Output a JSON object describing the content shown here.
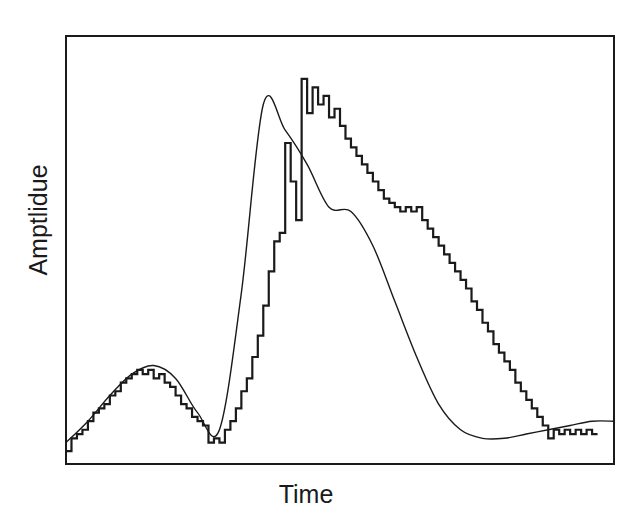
{
  "chart_data": {
    "type": "line",
    "title": "",
    "xlabel": "Time",
    "ylabel": "Amptlidue",
    "grid": false,
    "legend": null,
    "axis_ticks": false,
    "xlim": [
      0,
      100
    ],
    "ylim": [
      0,
      100
    ],
    "series": [
      {
        "name": "smooth-signal",
        "style": "smooth-line",
        "x": [
          0,
          4,
          8,
          12,
          16,
          20,
          24,
          28,
          32,
          36,
          40,
          44,
          48,
          52,
          56,
          60,
          64,
          68,
          72,
          76,
          80,
          84,
          88,
          92,
          96,
          100
        ],
        "y": [
          5,
          10,
          16,
          21,
          23,
          20,
          12,
          8,
          40,
          84,
          78,
          70,
          60,
          59,
          51,
          38,
          25,
          14,
          8,
          6,
          6,
          7,
          8,
          9,
          10,
          10
        ]
      },
      {
        "name": "quantized-staircase",
        "style": "step-line",
        "x": [
          0,
          1,
          2,
          3,
          4,
          5,
          6,
          7,
          8,
          9,
          10,
          11,
          12,
          13,
          14,
          15,
          16,
          17,
          18,
          19,
          20,
          21,
          22,
          23,
          24,
          25,
          26,
          27,
          28,
          29,
          30,
          31,
          32,
          33,
          34,
          35,
          36,
          37,
          38,
          39,
          40,
          41,
          42,
          43,
          44,
          45,
          46,
          47,
          48,
          49,
          50,
          51,
          52,
          53,
          54,
          55,
          56,
          57,
          58,
          59,
          60,
          61,
          62,
          63,
          64,
          65,
          66,
          67,
          68,
          69,
          70,
          71,
          72,
          73,
          74,
          75,
          76,
          77,
          78,
          79,
          80,
          81,
          82,
          83,
          84,
          85,
          86,
          87,
          88,
          89,
          90,
          91,
          92,
          93,
          94,
          95,
          96
        ],
        "y": [
          3,
          6,
          7,
          8,
          10,
          12,
          13,
          14,
          16,
          17,
          19,
          20,
          21,
          22,
          21,
          22,
          20,
          21,
          19,
          18,
          16,
          14,
          13,
          11,
          10,
          9,
          5,
          6,
          5,
          8,
          10,
          13,
          17,
          20,
          25,
          30,
          37,
          45,
          52,
          54,
          75,
          66,
          57,
          90,
          82,
          88,
          84,
          86,
          81,
          83,
          79,
          76,
          74,
          72,
          70,
          68,
          66,
          64,
          62,
          61,
          60,
          59,
          60,
          59,
          60,
          57,
          55,
          53,
          51,
          49,
          47,
          45,
          43,
          41,
          38,
          36,
          33,
          31,
          28,
          26,
          24,
          22,
          19,
          17,
          15,
          13,
          11,
          9,
          6,
          8,
          7,
          8,
          7,
          8,
          7,
          8,
          7
        ]
      }
    ],
    "annotations": []
  }
}
